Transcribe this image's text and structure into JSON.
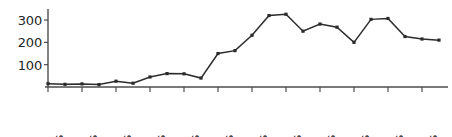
{
  "chart_data": {
    "type": "line",
    "title": "",
    "subtitle": "",
    "xlabel": "",
    "ylabel": "",
    "legend": [],
    "legend_position": "none",
    "grid": false,
    "xlim": [
      "1560s",
      "1790s"
    ],
    "ylim": [
      0,
      345
    ],
    "ytick_values": [
      100,
      200,
      300
    ],
    "ytick_labels": [
      "100",
      "200",
      "300"
    ],
    "xtick_labels": [
      "1560s",
      "1580s",
      "1600s",
      "1620s",
      "1640s",
      "1660s",
      "1680s",
      "1700s",
      "1720s",
      "1740s",
      "1760s",
      "1780s"
    ],
    "categories": [
      "1560s",
      "1570s",
      "1580s",
      "1590s",
      "1600s",
      "1610s",
      "1620s",
      "1630s",
      "1640s",
      "1650s",
      "1660s",
      "1670s",
      "1680s",
      "1690s",
      "1700s",
      "1710s",
      "1720s",
      "1730s",
      "1740s",
      "1750s",
      "1760s",
      "1770s",
      "1780s",
      "1790s"
    ],
    "values": [
      15,
      12,
      14,
      11,
      26,
      17,
      45,
      60,
      59,
      40,
      150,
      163,
      232,
      320,
      326,
      250,
      282,
      268,
      200,
      303,
      307,
      226,
      215,
      210
    ],
    "series": [
      {
        "name": "series-1",
        "values": [
          15,
          12,
          14,
          11,
          26,
          17,
          45,
          60,
          59,
          40,
          150,
          163,
          232,
          320,
          326,
          250,
          282,
          268,
          200,
          303,
          307,
          226,
          215,
          210
        ]
      }
    ],
    "marker": "square",
    "line_color": "#2b2b2b",
    "axis_color": "#4d4d4d",
    "text_color": "#262626",
    "background_color": "#ffffff"
  },
  "layout": {
    "plot_left": 48,
    "plot_right": 448,
    "plot_baseline_y": 87,
    "plot_top_y": 10,
    "value_at_top": 345,
    "tick_step_px": 17.0,
    "xlabel_tick_step": 2,
    "xlabel_baseline_y": 93,
    "xlabel_text_bottom": 135
  }
}
